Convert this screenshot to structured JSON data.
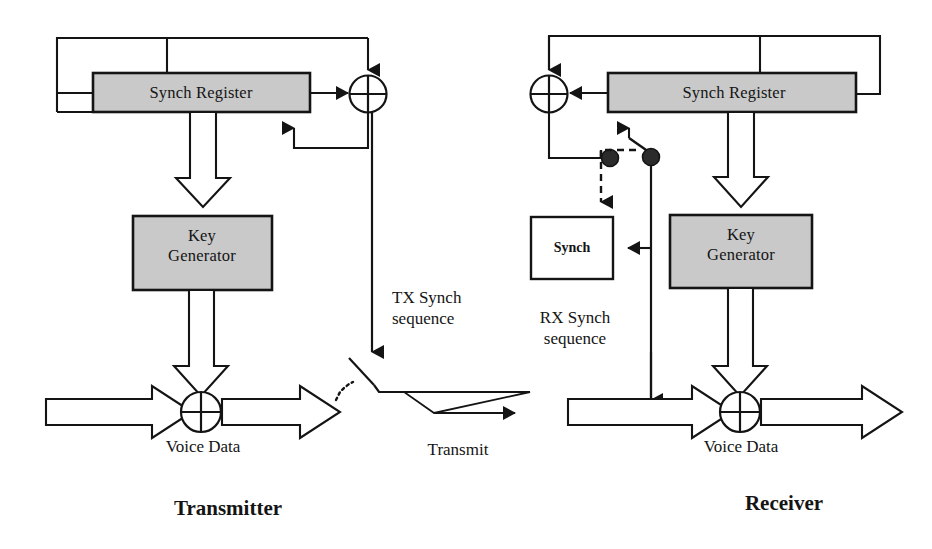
{
  "diagram": {
    "colors": {
      "stroke": "#141414",
      "fill_shaded": "#c9c9c9",
      "fill_plain": "#ffffff",
      "background": "#ffffff",
      "text": "#141414"
    },
    "sections": [
      {
        "id": "transmitter",
        "label": "Transmitter"
      },
      {
        "id": "receiver",
        "label": "Receiver"
      }
    ],
    "transmitter": {
      "blocks": [
        {
          "id": "tx-synch-register",
          "label": "Synch Register",
          "style": "shaded"
        },
        {
          "id": "tx-key-generator",
          "label_line1": "Key",
          "label_line2": "Generator",
          "style": "shaded"
        }
      ],
      "operators": [
        {
          "id": "tx-feedback-xor",
          "symbol": "xor"
        },
        {
          "id": "tx-voice-xor",
          "symbol": "xor"
        }
      ],
      "labels": [
        {
          "id": "tx-voice-data",
          "text": "Voice  Data"
        },
        {
          "id": "tx-synch-sequence",
          "line1": "TX Synch",
          "line2": "sequence"
        }
      ],
      "switch": {
        "id": "tx-transmit-switch",
        "state": "open"
      }
    },
    "channel": {
      "label": "Transmit"
    },
    "receiver": {
      "blocks": [
        {
          "id": "rx-synch-register",
          "label": "Synch Register",
          "style": "shaded"
        },
        {
          "id": "rx-key-generator",
          "label_line1": "Key",
          "label_line2": "Generator",
          "style": "shaded"
        },
        {
          "id": "rx-synch",
          "label": "Synch",
          "style": "plain"
        }
      ],
      "operators": [
        {
          "id": "rx-feedback-xor",
          "symbol": "xor"
        },
        {
          "id": "rx-voice-xor",
          "symbol": "xor"
        }
      ],
      "labels": [
        {
          "id": "rx-voice-data",
          "text": "Voice Data"
        },
        {
          "id": "rx-synch-sequence",
          "line1": "RX Synch",
          "line2": "sequence"
        }
      ],
      "switch": {
        "id": "rx-select-switch",
        "state": "toggle"
      }
    }
  }
}
